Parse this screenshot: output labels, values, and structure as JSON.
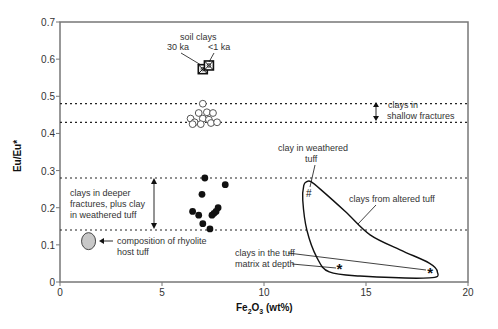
{
  "chart_data": {
    "type": "scatter",
    "title": "",
    "xlabel": "Fe2O3 (wt%)",
    "ylabel": "Eu/Eu*",
    "xlim": [
      0,
      20
    ],
    "ylim": [
      0,
      0.7
    ],
    "xticks": [
      0,
      5,
      10,
      15,
      20
    ],
    "yticks": [
      0,
      0.1,
      0.2,
      0.3,
      0.4,
      0.5,
      0.6,
      0.7
    ],
    "grid": false,
    "series": [
      {
        "name": "soil clays",
        "marker": "crossed-square",
        "points": [
          {
            "x": 7.0,
            "y": 0.573,
            "label": "30 ka"
          },
          {
            "x": 7.3,
            "y": 0.583,
            "label": "<1 ka"
          }
        ]
      },
      {
        "name": "clays in shallow fractures",
        "marker": "open-circle",
        "points": [
          {
            "x": 7.0,
            "y": 0.48
          },
          {
            "x": 6.8,
            "y": 0.455
          },
          {
            "x": 7.2,
            "y": 0.457
          },
          {
            "x": 7.5,
            "y": 0.455
          },
          {
            "x": 6.4,
            "y": 0.44
          },
          {
            "x": 7.0,
            "y": 0.44
          },
          {
            "x": 7.3,
            "y": 0.437
          },
          {
            "x": 6.6,
            "y": 0.43
          },
          {
            "x": 6.5,
            "y": 0.425
          },
          {
            "x": 6.9,
            "y": 0.425
          },
          {
            "x": 7.4,
            "y": 0.428
          },
          {
            "x": 7.7,
            "y": 0.43
          }
        ]
      },
      {
        "name": "clays in deeper fractures, plus clay in weathered tuff",
        "marker": "filled-circle",
        "points": [
          {
            "x": 7.1,
            "y": 0.28
          },
          {
            "x": 8.1,
            "y": 0.262
          },
          {
            "x": 6.96,
            "y": 0.236
          },
          {
            "x": 6.5,
            "y": 0.19
          },
          {
            "x": 6.8,
            "y": 0.18
          },
          {
            "x": 7.75,
            "y": 0.2
          },
          {
            "x": 7.55,
            "y": 0.185
          },
          {
            "x": 7.45,
            "y": 0.18
          },
          {
            "x": 7.65,
            "y": 0.19
          },
          {
            "x": 7.0,
            "y": 0.157
          },
          {
            "x": 7.35,
            "y": 0.143
          }
        ]
      },
      {
        "name": "composition of rhyolite host tuff",
        "marker": "gray-ellipse",
        "points": [
          {
            "x": 1.4,
            "y": 0.11
          }
        ]
      },
      {
        "name": "clay in weathered tuff",
        "marker": "hash",
        "points": [
          {
            "x": 12.2,
            "y": 0.24
          }
        ]
      },
      {
        "name": "clays in the tuff matrix at depth",
        "marker": "star",
        "points": [
          {
            "x": 13.7,
            "y": 0.04
          },
          {
            "x": 18.15,
            "y": 0.03
          }
        ]
      }
    ],
    "reference_lines": [
      {
        "axis": "y",
        "value": 0.48,
        "style": "dotted"
      },
      {
        "axis": "y",
        "value": 0.43,
        "style": "dotted"
      },
      {
        "axis": "y",
        "value": 0.28,
        "style": "dotted"
      },
      {
        "axis": "y",
        "value": 0.14,
        "style": "dotted"
      }
    ],
    "field": {
      "name": "clays from altered tuff",
      "polygon": [
        [
          12.1,
          0.27
        ],
        [
          11.95,
          0.26
        ],
        [
          11.9,
          0.22
        ],
        [
          12.1,
          0.14
        ],
        [
          12.6,
          0.065
        ],
        [
          13.2,
          0.027
        ],
        [
          14.7,
          0.016
        ],
        [
          18.1,
          0.011
        ],
        [
          18.5,
          0.027
        ],
        [
          18.1,
          0.051
        ],
        [
          16.7,
          0.086
        ],
        [
          15.2,
          0.127
        ],
        [
          14.0,
          0.189
        ],
        [
          12.8,
          0.248
        ],
        [
          12.3,
          0.27
        ]
      ]
    },
    "annotations": [
      {
        "text": "soil clays",
        "x": 6.8,
        "y": 0.625
      },
      {
        "text": "30 ka",
        "x": 5.9,
        "y": 0.6
      },
      {
        "text": "<1 ka",
        "x": 7.8,
        "y": 0.6
      },
      {
        "text": "clays in shallow fractures",
        "x": 18.0,
        "y": 0.455
      },
      {
        "text": "clays in deeper fractures, plus clay in weathered tuff",
        "x": 0.5,
        "y": 0.21
      },
      {
        "text": "composition of rhyolite host tuff",
        "x": 3.5,
        "y": 0.1
      },
      {
        "text": "clay in weathered tuff",
        "x": 12.0,
        "y": 0.32
      },
      {
        "text": "clays from altered tuff",
        "x": 15.0,
        "y": 0.225
      },
      {
        "text": "clays in the tuff matrix at depth",
        "x": 8.8,
        "y": 0.065
      }
    ]
  },
  "labels": {
    "y_axis": "Eu/Eu*",
    "x_axis_main": "Fe",
    "x_axis_sub1": "2",
    "x_axis_mid": "O",
    "x_axis_sub2": "3",
    "x_axis_unit": " (wt%)",
    "soil_clays": "soil clays",
    "ka30": "30 ka",
    "ka1": "<1 ka",
    "shallow_1": "clays in",
    "shallow_2": "shallow fractures",
    "deeper_1": "clays in deeper",
    "deeper_2": "fractures, plus clay",
    "deeper_3": "in weathered tuff",
    "rhyolite_1": "composition of rhyolite",
    "rhyolite_2": "host tuff",
    "weathered_1": "clay in weathered",
    "weathered_2": "tuff",
    "altered": "clays from altered tuff",
    "matrix_1": "clays in the tuff",
    "matrix_2": "matrix at depth",
    "hash_mark": "#",
    "star_mark": "*"
  },
  "colors": {
    "axis": "#777777",
    "ink": "#111111",
    "text": "#333333",
    "host_fill": "#c8c8c8"
  }
}
